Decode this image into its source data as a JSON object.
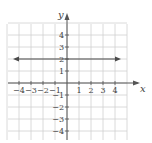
{
  "chart_data": {
    "type": "line",
    "title": "",
    "xlabel": "x",
    "ylabel": "y",
    "xlim": [
      -5,
      5
    ],
    "ylim": [
      -5,
      5
    ],
    "grid": true,
    "x_ticks": [
      "-4",
      "-3",
      "-2",
      "-1",
      "1",
      "2",
      "3",
      "4"
    ],
    "y_ticks": [
      "4",
      "3",
      "2",
      "1",
      "-1",
      "-2",
      "-3",
      "-4"
    ],
    "series": [
      {
        "name": "y = 2",
        "x": [
          -4.5,
          4.5
        ],
        "y": [
          2,
          2
        ],
        "style": "horizontal line with arrows at both ends"
      }
    ]
  },
  "labels": {
    "x_axis": "x",
    "y_axis": "y"
  },
  "colors": {
    "grid": "#d0d0d0",
    "axis": "#555555",
    "line": "#4a4a4a"
  }
}
